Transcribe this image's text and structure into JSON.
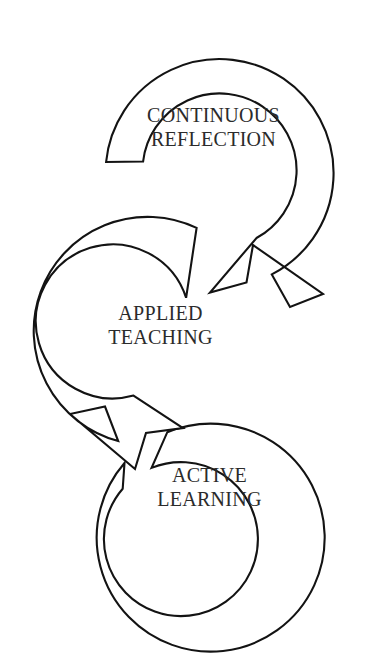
{
  "diagram": {
    "type": "cyclical-process-diagram",
    "background_color": "#ffffff",
    "stroke_color": "#131313",
    "text_color": "#2b2b2b",
    "stages": [
      {
        "id": "continuous-reflection",
        "order": 1,
        "line1": "CONTINUOUS",
        "line2": "REFLECTION",
        "center": [
          220,
          175
        ],
        "outer_radius": 114,
        "inner_radius": 77
      },
      {
        "id": "applied-teaching",
        "order": 2,
        "line1": "APPLIED",
        "line2": "TEACHING",
        "center": [
          146,
          330
        ],
        "outer_radius": 114,
        "inner_radius": 77
      },
      {
        "id": "active-learning",
        "order": 3,
        "line1": "ACTIVE",
        "line2": "LEARNING",
        "center": [
          228,
          516
        ],
        "outer_radius": 114,
        "inner_radius": 77
      }
    ],
    "arrows": [
      {
        "id": "arrow-reflection-to-teaching",
        "from": "continuous-reflection",
        "to": "applied-teaching",
        "direction": "down-left"
      },
      {
        "id": "arrow-teaching-to-learning",
        "from": "applied-teaching",
        "to": "active-learning",
        "direction": "down-right"
      }
    ]
  }
}
